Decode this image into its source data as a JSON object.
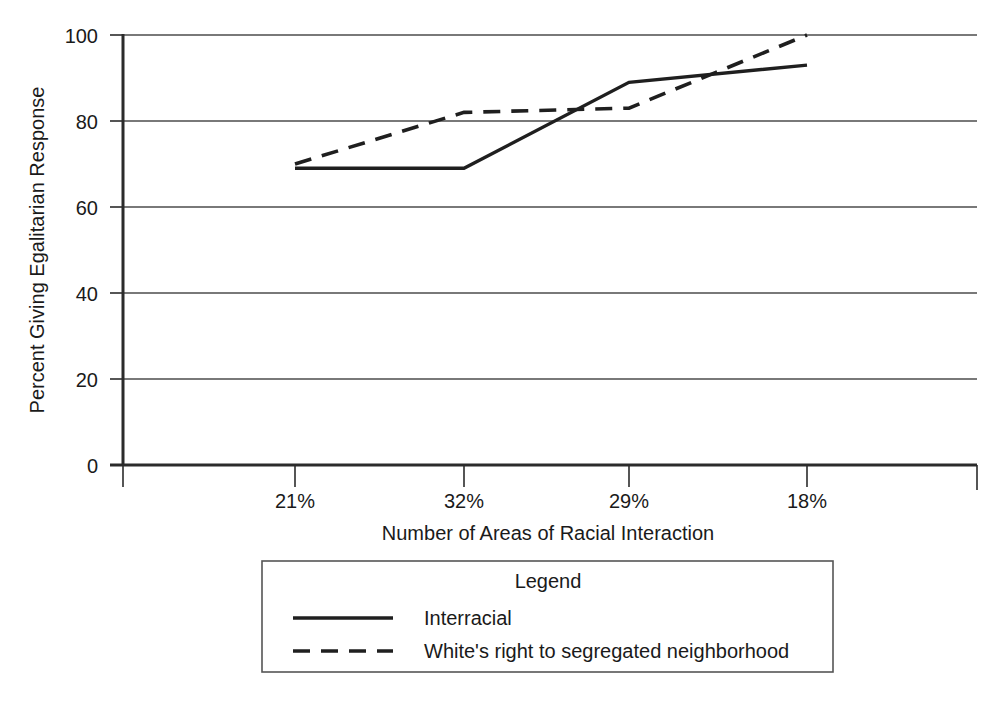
{
  "chart_data": {
    "type": "line",
    "title": "",
    "xlabel": "Number of Areas of Racial Interaction",
    "ylabel": "Percent Giving Egalitarian Response",
    "categories": [
      "21%",
      "32%",
      "29%",
      "18%"
    ],
    "x_tick_labels": [
      "21%",
      "32%",
      "29%",
      "18%"
    ],
    "y_tick_labels": [
      "0",
      "20",
      "40",
      "60",
      "80",
      "100"
    ],
    "y_ticks": [
      0,
      20,
      40,
      60,
      80,
      100
    ],
    "ylim": [
      0,
      100
    ],
    "grid": "horizontal",
    "legend_position": "below-plot",
    "legend_title": "Legend",
    "series": [
      {
        "name": "Interracial",
        "style": "solid",
        "values": [
          69,
          69,
          89,
          93
        ]
      },
      {
        "name": "White's right to segregated neighborhood",
        "style": "dashed",
        "values": [
          70,
          82,
          83,
          100
        ]
      }
    ]
  },
  "axes": {
    "y_title": "Percent Giving Egalitarian Response",
    "x_title": "Number of Areas of Racial Interaction",
    "y_labels": [
      "100",
      "80",
      "60",
      "40",
      "20",
      "0"
    ],
    "x_labels": [
      "21%",
      "32%",
      "29%",
      "18%"
    ]
  },
  "legend": {
    "title": "Legend",
    "entries": [
      {
        "label": "Interracial",
        "style": "solid"
      },
      {
        "label": "White's right to segregated neighborhood",
        "style": "dashed"
      }
    ]
  },
  "colors": {
    "background": "#ffffff",
    "ink": "#1f1f1f",
    "grid": "#4d4d4d",
    "axis": "#2b2b2b",
    "legend_border": "#555555"
  }
}
